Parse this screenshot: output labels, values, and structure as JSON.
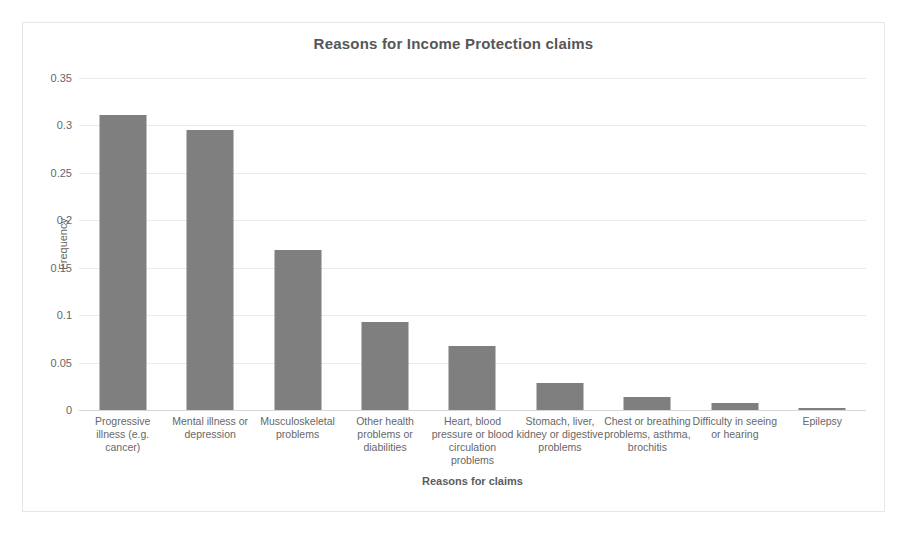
{
  "chart_data": {
    "type": "bar",
    "title": "Reasons for Income Protection claims",
    "xlabel": "Reasons for claims",
    "ylabel": "Frequency",
    "ylim": [
      0,
      0.35
    ],
    "ytick_values": [
      0,
      0.05,
      0.1,
      0.15,
      0.2,
      0.25,
      0.3,
      0.35
    ],
    "ytick_labels": [
      "0",
      "0.05",
      "0.1",
      "0.15",
      "0.2",
      "0.25",
      "0.3",
      "0.35"
    ],
    "grid": "horizontal",
    "legend": "none",
    "bar_color": "#7f7f7f",
    "gridline_color": "#e9eaec",
    "categories": [
      "Progressive illness (e.g. cancer)",
      "Mental illness or depression",
      "Musculoskeletal problems",
      "Other health problems or diabilities",
      "Heart, blood pressure or blood circulation problems",
      "Stomach, liver, kidney or digestive problems",
      "Chest or breathing problems, asthma, brochitis",
      "Difficulty in seeing or hearing",
      "Epilepsy"
    ],
    "values": [
      0.311,
      0.295,
      0.169,
      0.093,
      0.068,
      0.028,
      0.014,
      0.007,
      0.002
    ]
  }
}
